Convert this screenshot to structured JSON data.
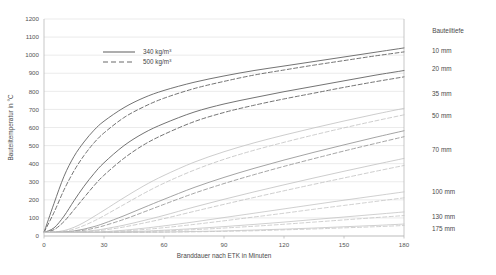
{
  "chart_data": {
    "type": "line",
    "title": "",
    "xlabel": "Branddauer nach ETK in Minuten",
    "ylabel": "Bauteiltemperatur in °C",
    "xlim": [
      0,
      180
    ],
    "ylim": [
      0,
      1200
    ],
    "xticks": [
      0,
      30,
      60,
      90,
      120,
      150,
      180
    ],
    "yticks": [
      0,
      100,
      200,
      300,
      400,
      500,
      600,
      700,
      800,
      900,
      1000,
      1100,
      1200
    ],
    "grid": "horizontal",
    "legend": {
      "position": "upper-left-inside",
      "entries": [
        {
          "label": "340 kg/m",
          "exponent": "3",
          "style": "solid"
        },
        {
          "label": "500 kg/m",
          "exponent": "3",
          "style": "dashed"
        }
      ]
    },
    "series_group_label": "Bauteiltiefe",
    "x": [
      0,
      5,
      10,
      15,
      20,
      25,
      30,
      40,
      50,
      60,
      75,
      90,
      105,
      120,
      135,
      150,
      165,
      180
    ],
    "series": [
      {
        "name": "10 mm - 340 kg/m3",
        "depth": "10 mm",
        "density": "340 kg/m3",
        "style": "solid",
        "values": [
          20,
          180,
          330,
          440,
          520,
          585,
          635,
          710,
          765,
          805,
          850,
          885,
          915,
          940,
          965,
          990,
          1015,
          1040
        ]
      },
      {
        "name": "10 mm - 500 kg/m3",
        "depth": "10 mm",
        "density": "500 kg/m3",
        "style": "dashed",
        "values": [
          20,
          130,
          255,
          360,
          445,
          515,
          570,
          655,
          715,
          762,
          815,
          855,
          890,
          918,
          945,
          970,
          995,
          1018
        ]
      },
      {
        "name": "20 mm - 340 kg/m3",
        "depth": "20 mm",
        "density": "340 kg/m3",
        "style": "solid",
        "values": [
          20,
          45,
          110,
          195,
          275,
          345,
          405,
          500,
          570,
          622,
          685,
          730,
          765,
          798,
          828,
          858,
          888,
          915
        ]
      },
      {
        "name": "20 mm - 500 kg/m3",
        "depth": "20 mm",
        "density": "500 kg/m3",
        "style": "dashed",
        "values": [
          20,
          35,
          80,
          145,
          212,
          278,
          336,
          430,
          505,
          562,
          632,
          683,
          723,
          758,
          790,
          822,
          852,
          880
        ]
      },
      {
        "name": "35 mm - 340 kg/m3",
        "depth": "35 mm",
        "density": "340 kg/m3",
        "style": "solid",
        "values": [
          20,
          22,
          30,
          48,
          75,
          108,
          142,
          212,
          278,
          335,
          408,
          466,
          515,
          558,
          598,
          636,
          672,
          706
        ]
      },
      {
        "name": "35 mm - 500 kg/m3",
        "depth": "35 mm",
        "density": "500 kg/m3",
        "style": "dashed",
        "values": [
          20,
          21,
          26,
          38,
          58,
          83,
          112,
          174,
          236,
          292,
          364,
          424,
          474,
          518,
          559,
          598,
          635,
          670
        ]
      },
      {
        "name": "50 mm - 340 kg/m3",
        "depth": "50 mm",
        "density": "340 kg/m3",
        "style": "solid",
        "values": [
          20,
          20,
          22,
          28,
          38,
          52,
          70,
          112,
          158,
          203,
          268,
          324,
          374,
          420,
          463,
          504,
          544,
          582
        ]
      },
      {
        "name": "50 mm - 500 kg/m3",
        "depth": "50 mm",
        "density": "500 kg/m3",
        "style": "dashed",
        "values": [
          20,
          20,
          21,
          25,
          32,
          43,
          57,
          92,
          133,
          175,
          236,
          290,
          339,
          385,
          428,
          470,
          510,
          549
        ]
      },
      {
        "name": "70 mm - 340 kg/m3",
        "depth": "70 mm",
        "density": "340 kg/m3",
        "style": "solid",
        "values": [
          20,
          20,
          20,
          22,
          25,
          31,
          39,
          60,
          86,
          114,
          160,
          203,
          244,
          283,
          321,
          358,
          394,
          429
        ]
      },
      {
        "name": "70 mm - 500 kg/m3",
        "depth": "70 mm",
        "density": "500 kg/m3",
        "style": "dashed",
        "values": [
          20,
          20,
          20,
          21,
          23,
          27,
          33,
          50,
          72,
          96,
          136,
          175,
          213,
          250,
          286,
          321,
          356,
          390
        ]
      },
      {
        "name": "100 mm - 340 kg/m3",
        "depth": "100 mm",
        "density": "340 kg/m3",
        "style": "solid",
        "values": [
          20,
          20,
          20,
          20,
          21,
          22,
          24,
          32,
          43,
          56,
          78,
          102,
          126,
          150,
          174,
          198,
          221,
          244
        ]
      },
      {
        "name": "100 mm - 500 kg/m3",
        "depth": "100 mm",
        "density": "500 kg/m3",
        "style": "dashed",
        "values": [
          20,
          20,
          20,
          20,
          20,
          21,
          23,
          28,
          36,
          46,
          64,
          84,
          105,
          126,
          148,
          169,
          190,
          211
        ]
      },
      {
        "name": "130 mm - 340 kg/m3",
        "depth": "130 mm",
        "density": "340 kg/m3",
        "style": "solid",
        "values": [
          20,
          20,
          20,
          20,
          20,
          20,
          21,
          23,
          27,
          32,
          41,
          52,
          64,
          77,
          91,
          105,
          119,
          133
        ]
      },
      {
        "name": "130 mm - 500 kg/m3",
        "depth": "130 mm",
        "density": "500 kg/m3",
        "style": "dashed",
        "values": [
          20,
          20,
          20,
          20,
          20,
          20,
          20,
          22,
          24,
          28,
          35,
          44,
          54,
          65,
          77,
          89,
          101,
          113
        ]
      },
      {
        "name": "175 mm - 340 kg/m3",
        "depth": "175 mm",
        "density": "340 kg/m3",
        "style": "solid",
        "values": [
          20,
          20,
          20,
          20,
          20,
          20,
          20,
          20,
          21,
          22,
          25,
          28,
          33,
          38,
          44,
          51,
          58,
          66
        ]
      },
      {
        "name": "175 mm - 500 kg/m3",
        "depth": "175 mm",
        "density": "500 kg/m3",
        "style": "dashed",
        "values": [
          20,
          20,
          20,
          20,
          20,
          20,
          20,
          20,
          20,
          21,
          23,
          26,
          29,
          34,
          39,
          45,
          51,
          58
        ]
      }
    ],
    "depth_labels": [
      {
        "text": "10 mm",
        "y_value": 1040
      },
      {
        "text": "20 mm",
        "y_value": 915
      },
      {
        "text": "35 mm",
        "y_value": 706
      },
      {
        "text": "50 mm",
        "y_value": 582
      },
      {
        "text": "70 mm",
        "y_value": 429
      },
      {
        "text": "100 mm",
        "y_value": 244
      },
      {
        "text": "130 mm",
        "y_value": 133
      },
      {
        "text": "175 mm",
        "y_value": 66
      }
    ],
    "colors": {
      "grid": "#e2e2e2",
      "axis": "#b9b9b9",
      "text": "#4a4a4a",
      "curve_dark": "#6b6b6b",
      "curve_mid": "#9a9a9a",
      "curve_light": "#c4c4c4",
      "background": "#ffffff"
    }
  }
}
